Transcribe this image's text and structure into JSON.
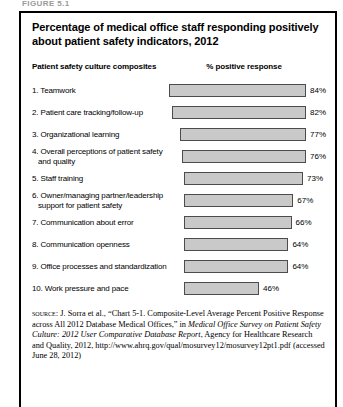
{
  "figure_label": "FIGURE 5.1",
  "chart": {
    "title": "Percentage of medical office staff responding positively about patient safety indicators, 2012",
    "header_left": "Patient safety culture composites",
    "header_right": "% positive response"
  },
  "chart_data": {
    "type": "bar",
    "orientation": "horizontal",
    "title": "Percentage of medical office staff responding positively about patient safety indicators, 2012",
    "xlabel": "% positive response",
    "ylabel": "Patient safety culture composites",
    "xlim": [
      0,
      100
    ],
    "grid": false,
    "legend": "none",
    "categories": [
      "1. Teamwork",
      "2. Patient care tracking/follow-up",
      "3. Organizational learning",
      "4. Overall perceptions of patient safety and quality",
      "5. Staff training",
      "6. Owner/managing partner/leadership support for patient safety",
      "7. Communication about error",
      "8. Communication openness",
      "9. Office processes and standardization",
      "10. Work pressure and pace"
    ],
    "values": [
      84,
      82,
      77,
      76,
      73,
      67,
      66,
      64,
      64,
      46
    ],
    "value_labels": [
      "84%",
      "82%",
      "77%",
      "76%",
      "73%",
      "67%",
      "66%",
      "64%",
      "64%",
      "46%"
    ],
    "bar_fill_color": "#c9c9c9",
    "bar_border_color": "#4c4c4c"
  },
  "rows": [
    {
      "label": "1. Teamwork",
      "label2": "",
      "value": 84,
      "value_label": "84%"
    },
    {
      "label": "2. Patient care tracking/follow-up",
      "label2": "",
      "value": 82,
      "value_label": "82%"
    },
    {
      "label": "3. Organizational learning",
      "label2": "",
      "value": 77,
      "value_label": "77%"
    },
    {
      "label": "4. Overall perceptions of patient safety",
      "label2": "and quality",
      "value": 76,
      "value_label": "76%"
    },
    {
      "label": "5. Staff training",
      "label2": "",
      "value": 73,
      "value_label": "73%"
    },
    {
      "label": "6. Owner/managing partner/leadership",
      "label2": "support for patient safety",
      "value": 67,
      "value_label": "67%"
    },
    {
      "label": "7. Communication about error",
      "label2": "",
      "value": 66,
      "value_label": "66%"
    },
    {
      "label": "8. Communication openness",
      "label2": "",
      "value": 64,
      "value_label": "64%"
    },
    {
      "label": "9. Office processes and standardization",
      "label2": "",
      "value": 64,
      "value_label": "64%"
    },
    {
      "label": "10. Work pressure and pace",
      "label2": "",
      "value": 46,
      "value_label": "46%"
    }
  ],
  "source": {
    "label": "source:",
    "part1": " J. Sorra et al., “Chart 5-1. Composite-Level Average Percent Positive Response across All 2012 Database Medical Offices,” in ",
    "italic": "Medical Office Survey on Patient Safety Culture: 2012 User Comparative Database Report",
    "part2": ", Agency for Healthcare Research and Quality, 2012, http://www.ahrq.gov/qual/mosurvey12/mosurvey12pt1.pdf (accessed June 28, 2012)"
  }
}
